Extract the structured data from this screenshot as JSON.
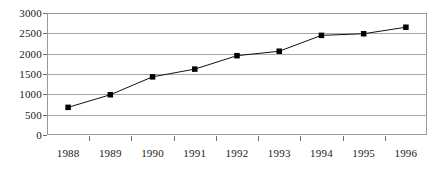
{
  "chart_data": {
    "type": "line",
    "title": "",
    "xlabel": "",
    "ylabel": "",
    "categories": [
      "1988",
      "1989",
      "1990",
      "1991",
      "1992",
      "1993",
      "1994",
      "1995",
      "1996"
    ],
    "values": [
      680,
      990,
      1430,
      1620,
      1950,
      2060,
      2450,
      2490,
      2650
    ],
    "ylim": [
      0,
      3000
    ],
    "ytick_values": [
      0,
      500,
      1000,
      1500,
      2000,
      2500,
      3000
    ],
    "ytick_labels": [
      "0",
      "500",
      "1000",
      "1500",
      "2000",
      "2500",
      "3000"
    ],
    "grid": true,
    "legend": false,
    "marker": "square",
    "series_color": "#000000",
    "gridline_color": "#a8a8a8",
    "border_color": "#9a9a9a",
    "background_color": "#ffffff"
  }
}
